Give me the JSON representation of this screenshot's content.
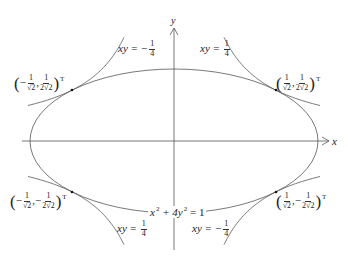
{
  "diagram": {
    "type": "ellipse-hyperbola-tangency",
    "colors": {
      "curve": "#555555",
      "axis": "#555555",
      "point": "#111111",
      "text": "#222222"
    },
    "axes": {
      "x_label": "x",
      "y_label": "y"
    },
    "ellipse": {
      "equation": "x² + 4y² = 1",
      "lhs_a": "x",
      "lhs_b": "+ 4y",
      "rhs": "= 1",
      "exp": "2"
    },
    "hyperbolas": [
      {
        "id": "upper-left",
        "lhs": "xy = −",
        "num": "1",
        "den": "4"
      },
      {
        "id": "upper-right",
        "lhs": "xy = ",
        "num": "1",
        "den": "4"
      },
      {
        "id": "lower-left",
        "lhs": "xy = ",
        "num": "1",
        "den": "4"
      },
      {
        "id": "lower-right",
        "lhs": "xy = −",
        "num": "1",
        "den": "4"
      }
    ],
    "points": [
      {
        "id": "upper-left",
        "x_sign": "−",
        "x_num": "1",
        "x_den": "√2",
        "y_sign": "",
        "y_num": "1",
        "y_den": "2√2",
        "transpose": "T"
      },
      {
        "id": "upper-right",
        "x_sign": "",
        "x_num": "1",
        "x_den": "√2",
        "y_sign": "",
        "y_num": "1",
        "y_den": "2√2",
        "transpose": "T"
      },
      {
        "id": "lower-left",
        "x_sign": "−",
        "x_num": "1",
        "x_den": "√2",
        "y_sign": "−",
        "y_num": "1",
        "y_den": "2√2",
        "transpose": "T"
      },
      {
        "id": "lower-right",
        "x_sign": "",
        "x_num": "1",
        "x_den": "√2",
        "y_sign": "−",
        "y_num": "1",
        "y_den": "2√2",
        "transpose": "T"
      }
    ]
  }
}
